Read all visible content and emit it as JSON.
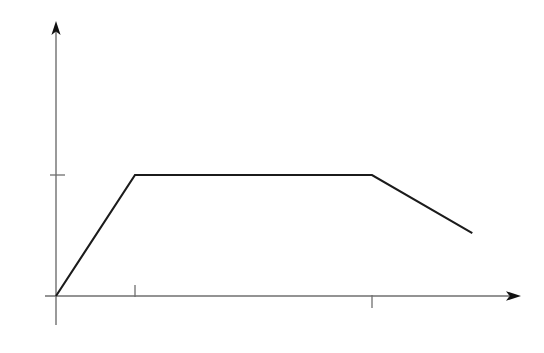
{
  "chart_data": {
    "type": "line",
    "title": "",
    "subtitle": "",
    "xlabel": "",
    "ylabel": "",
    "grid": false,
    "legend": false,
    "legend_position": "none",
    "annotations": [],
    "series": [
      {
        "name": "profile",
        "color": "#1b1b1b",
        "x": [
          0,
          1,
          4,
          5.27
        ],
        "y": [
          0,
          1,
          1,
          0.52
        ],
        "points": [
          {
            "x": 0,
            "y": 0,
            "role": "origin-start"
          },
          {
            "x": 1,
            "y": 1,
            "role": "rise-knee"
          },
          {
            "x": 4,
            "y": 1,
            "role": "plateau-end"
          },
          {
            "x": 5.27,
            "y": 0.52,
            "role": "decline-end"
          }
        ]
      }
    ],
    "xlim": [
      -0.14,
      5.9
    ],
    "ylim": [
      -0.37,
      2.26
    ],
    "x_ticks": [
      {
        "value": 1,
        "label": "",
        "direction": "up"
      },
      {
        "value": 4,
        "label": "",
        "direction": "down"
      }
    ],
    "y_ticks": [
      {
        "value": 1,
        "label": "",
        "direction": "right"
      }
    ],
    "axes": {
      "x_axis": {
        "arrow": true,
        "arrow_position": "right",
        "color": "#6f6f6f"
      },
      "y_axis": {
        "arrow": true,
        "arrow_position": "top",
        "color": "#6f6f6f"
      }
    }
  },
  "figure": {
    "background_color": "#ffffff",
    "line_color": "#1b1b1b",
    "axis_color": "#6f6f6f",
    "width": 544,
    "height": 353,
    "alt_text": "Line chart showing a trapezoid shape with no axis labels"
  }
}
